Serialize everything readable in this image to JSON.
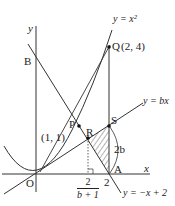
{
  "figure": {
    "axis_labels": {
      "x": "x",
      "y": "y",
      "origin": "O"
    },
    "curves": {
      "parabola": "y = x²",
      "line_bx": "y = bx",
      "line_neg": "y = −x + 2"
    },
    "points": {
      "B": "B",
      "P": "P",
      "Q": "Q",
      "Q_coord": "(2,  4)",
      "R": "R",
      "S": "S",
      "A": "A",
      "tangent_point": "(1,  1)"
    },
    "annotations": {
      "segment_SA": "2b",
      "tick_two": "2",
      "frac_num": "2",
      "frac_den": "b + 1"
    },
    "colors": {
      "stroke": "#333333",
      "hatch": "#444444",
      "background": "#ffffff"
    }
  }
}
